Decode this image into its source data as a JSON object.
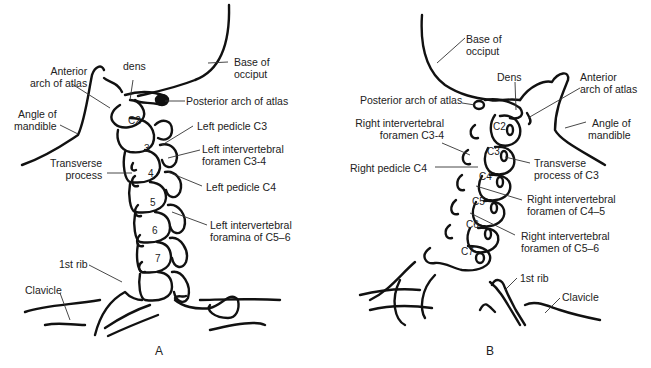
{
  "panels": {
    "A": {
      "letter": "A",
      "labels": {
        "anterior_arch_1": "Anterior",
        "anterior_arch_2": "arch of atlas",
        "dens": "dens",
        "base_occiput_1": "Base of",
        "base_occiput_2": "occiput",
        "posterior_arch": "Posterior arch of atlas",
        "angle_mandible_1": "Angle of",
        "angle_mandible_2": "mandible",
        "left_pedicle_c3": "Left pedicle C3",
        "left_iv_foramen_1": "Left intervertebral",
        "left_iv_foramen_2": "foramen C3-4",
        "transverse_1": "Transverse",
        "transverse_2": "process",
        "left_pedicle_c4": "Left pedicle C4",
        "left_iv_foramina_1": "Left intervertebral",
        "left_iv_foramina_2": "foramina of C5–6",
        "first_rib": "1st rib",
        "clavicle": "Clavicle"
      },
      "vertebrae": [
        "C2",
        "3",
        "4",
        "5",
        "6",
        "7"
      ]
    },
    "B": {
      "letter": "B",
      "labels": {
        "base_occiput_1": "Base of",
        "base_occiput_2": "occiput",
        "dens": "Dens",
        "anterior_arch_1": "Anterior",
        "anterior_arch_2": "arch of atlas",
        "posterior_arch": "Posterior arch of atlas",
        "angle_mandible_1": "Angle of",
        "angle_mandible_2": "mandible",
        "right_iv_c34_1": "Right intervertebral",
        "right_iv_c34_2": "foramen C3-4",
        "right_pedicle_c4": "Right pedicle C4",
        "transverse_c3_1": "Transverse",
        "transverse_c3_2": "process of C3",
        "right_iv_c45_1": "Right intervertebral",
        "right_iv_c45_2": "foramen of C4–5",
        "right_iv_c56_1": "Right intervertebral",
        "right_iv_c56_2": "foramen of C5–6",
        "first_rib": "1st rib",
        "clavicle": "Clavicle"
      },
      "vertebrae": [
        "C2",
        "C3",
        "C4",
        "C5",
        "C6",
        "C7"
      ]
    }
  }
}
